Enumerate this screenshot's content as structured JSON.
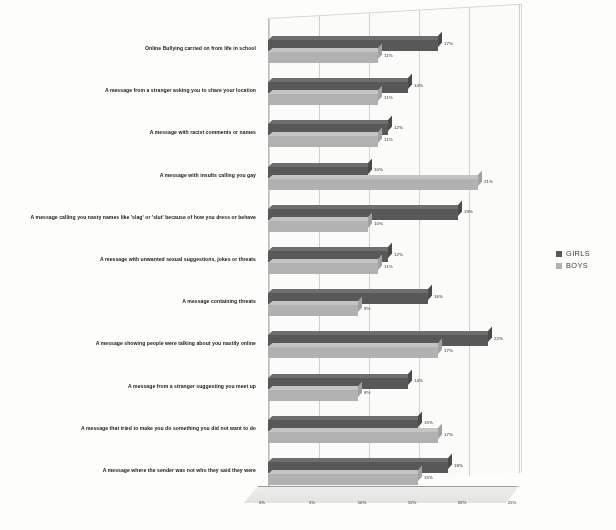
{
  "chart_data": {
    "type": "bar",
    "orientation": "horizontal",
    "title": "",
    "xlabel": "",
    "ylabel": "",
    "xlim": [
      0,
      25
    ],
    "xticks": [
      "0%",
      "5%",
      "10%",
      "15%",
      "20%",
      "25%"
    ],
    "grid": true,
    "legend_position": "right",
    "categories": [
      "Online Bullying carried on from life in school",
      "A message from a stranger asking you to share your location",
      "A message with racist comments or names",
      "A message with insults calling you gay",
      "A message calling you nasty names like 'slag' or 'slut' because of how you dress or behave",
      "A message with unwanted sexual suggestions, jokes or threats",
      "A message containing threats",
      "A message showing people were talking about you nastily online",
      "A message from a stranger suggesting you meet up",
      "A message that tried to make you do something you did not want to do",
      "A message where the sender was not who they said they were"
    ],
    "series": [
      {
        "name": "GIRLS",
        "color": "#595959",
        "values": [
          17,
          14,
          12,
          10,
          19,
          12,
          16,
          22,
          14,
          15,
          18
        ],
        "labels": [
          "17%",
          "14%",
          "12%",
          "10%",
          "19%",
          "12%",
          "16%",
          "22%",
          "14%",
          "15%",
          "18%"
        ]
      },
      {
        "name": "BOYS",
        "color": "#b3b3b3",
        "values": [
          11,
          11,
          11,
          21,
          10,
          11,
          9,
          17,
          9,
          17,
          15
        ],
        "labels": [
          "11%",
          "11%",
          "11%",
          "21%",
          "10%",
          "11%",
          "9%",
          "17%",
          "9%",
          "17%",
          "15%"
        ]
      }
    ]
  },
  "legend": {
    "items": [
      {
        "label": "GIRLS",
        "color": "#595959"
      },
      {
        "label": "BOYS",
        "color": "#b3b3b3"
      }
    ]
  },
  "caption": {
    "text": ""
  }
}
